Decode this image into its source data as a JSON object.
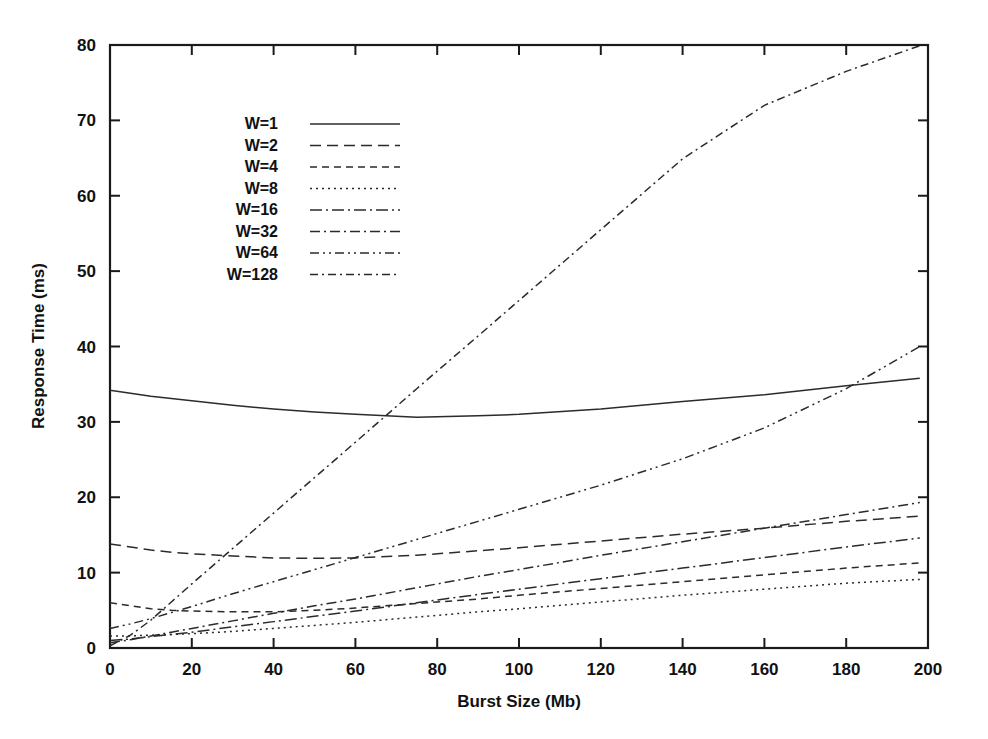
{
  "chart_data": {
    "type": "line",
    "title": "",
    "xlabel": "Burst Size (Mb)",
    "ylabel": "Response Time (ms)",
    "xlim": [
      0,
      200
    ],
    "ylim": [
      0,
      80
    ],
    "xticks": [
      "0",
      "20",
      "40",
      "60",
      "80",
      "100",
      "120",
      "140",
      "160",
      "180",
      "200"
    ],
    "yticks": [
      "0",
      "10",
      "20",
      "30",
      "40",
      "50",
      "60",
      "70",
      "80"
    ],
    "grid": false,
    "legend_position": "upper-left-inside",
    "x": [
      0,
      5,
      10,
      15,
      20,
      30,
      40,
      50,
      60,
      75,
      90,
      100,
      120,
      140,
      160,
      180,
      198
    ],
    "series": [
      {
        "name": "W=1",
        "style": "solid",
        "dash": "none",
        "values": [
          34.2,
          33.8,
          33.4,
          33.1,
          32.8,
          32.2,
          31.7,
          31.3,
          31.0,
          30.6,
          30.8,
          31.0,
          31.7,
          32.7,
          33.6,
          34.8,
          35.8
        ]
      },
      {
        "name": "W=2",
        "style": "dashed",
        "dash": "11,6",
        "values": [
          13.8,
          13.4,
          13.0,
          12.7,
          12.5,
          12.2,
          11.95,
          11.9,
          11.95,
          12.3,
          12.9,
          13.3,
          14.2,
          15.1,
          15.9,
          16.8,
          17.5
        ]
      },
      {
        "name": "W=4",
        "style": "short-dash",
        "dash": "7,5",
        "values": [
          6.0,
          5.6,
          5.2,
          5.0,
          4.9,
          4.8,
          4.8,
          5.0,
          5.3,
          5.9,
          6.5,
          7.0,
          7.9,
          8.8,
          9.7,
          10.6,
          11.3
        ]
      },
      {
        "name": "W=8",
        "style": "dotted",
        "dash": "2,4",
        "values": [
          1.6,
          1.6,
          1.7,
          1.8,
          1.9,
          2.2,
          2.6,
          3.0,
          3.4,
          4.1,
          4.8,
          5.2,
          6.1,
          7.0,
          7.8,
          8.6,
          9.1
        ]
      },
      {
        "name": "W=16",
        "style": "dash-dot",
        "dash": "12,4,2,4",
        "values": [
          1.0,
          1.2,
          1.5,
          1.8,
          2.1,
          2.8,
          3.5,
          4.2,
          4.9,
          6.0,
          7.1,
          7.8,
          9.2,
          10.6,
          12.0,
          13.4,
          14.6
        ]
      },
      {
        "name": "W=32",
        "style": "dash-dot",
        "dash": "10,4,2,4",
        "values": [
          0.7,
          1.1,
          1.6,
          2.1,
          2.6,
          3.6,
          4.6,
          5.6,
          6.5,
          8.0,
          9.5,
          10.4,
          12.3,
          14.1,
          15.9,
          17.7,
          19.3
        ]
      },
      {
        "name": "W=64",
        "style": "dash-dot-dot",
        "dash": "9,4,2,4,2,4",
        "values": [
          2.6,
          3.2,
          3.9,
          4.7,
          5.5,
          7.2,
          8.8,
          10.4,
          12.0,
          14.4,
          16.8,
          18.4,
          21.6,
          25.1,
          29.2,
          34.4,
          40.0
        ]
      },
      {
        "name": "W=128",
        "style": "dash-dot",
        "dash": "8,4,2,4",
        "values": [
          0.3,
          1.7,
          3.7,
          6.1,
          8.5,
          13.2,
          17.9,
          22.6,
          27.3,
          34.4,
          41.4,
          46.1,
          55.5,
          64.9,
          72.0,
          76.5,
          79.9
        ]
      }
    ]
  },
  "legend": {
    "entries": [
      {
        "label": "W=1"
      },
      {
        "label": "W=2"
      },
      {
        "label": "W=4"
      },
      {
        "label": "W=8"
      },
      {
        "label": "W=16"
      },
      {
        "label": "W=32"
      },
      {
        "label": "W=64"
      },
      {
        "label": "W=128"
      }
    ]
  },
  "colors": {
    "line": "#2b2b2b",
    "axis": "#1a1a1a",
    "background": "#ffffff"
  }
}
